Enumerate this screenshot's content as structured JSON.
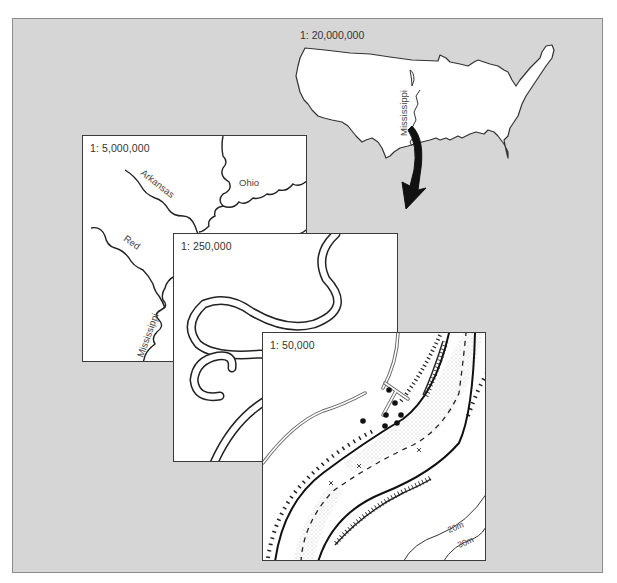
{
  "figure": {
    "colors": {
      "background": "#d6d6d6",
      "panel": "#ffffff",
      "line": "#222222",
      "stipple": "#b0b0b0"
    }
  },
  "maps": [
    {
      "id": "us",
      "scale_label": "1: 20,000,000",
      "river_labels": [
        "Mississippi"
      ],
      "icon": "us-outline-map"
    },
    {
      "id": "regional",
      "scale_label": "1: 5,000,000",
      "river_labels": [
        "Arkansas",
        "Ohio",
        "Red",
        "Mississippi"
      ]
    },
    {
      "id": "meander",
      "scale_label": "1: 250,000",
      "river_labels": []
    },
    {
      "id": "detail",
      "scale_label": "1: 50,000",
      "contour_labels": [
        "20m",
        "30m"
      ]
    }
  ],
  "arrow": {
    "icon": "curved-arrow-down"
  }
}
